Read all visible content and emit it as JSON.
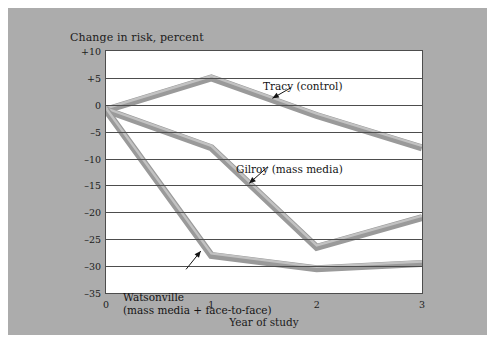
{
  "figure": {
    "background_color": "#ffffff",
    "panel_color": "#acacac",
    "plot_background": "#ffffff",
    "line_color": "#9a9a9a",
    "axis_color": "#4d4d4d",
    "text_color": "#1b1b1b"
  },
  "chart_data": {
    "type": "line",
    "title": "",
    "ylabel": "Change in risk, percent",
    "xlabel": "Year of study",
    "x": [
      0,
      1,
      2,
      3
    ],
    "xticklabels": [
      "0",
      "1",
      "2",
      "3"
    ],
    "xlim": [
      0,
      3
    ],
    "ylim": [
      -35,
      10
    ],
    "yticks": [
      10,
      5,
      0,
      -5,
      -10,
      -15,
      -20,
      -25,
      -30,
      -35
    ],
    "yticklabels": [
      "+10",
      "+5",
      "0",
      "–5",
      "–10",
      "–15",
      "–20",
      "–25",
      "–30",
      "–35"
    ],
    "grid": true,
    "grid_axis": "y",
    "legend": "annotations",
    "series": [
      {
        "name": "Tracy (control)",
        "label": "Tracy (control)",
        "values": [
          -1,
          5,
          -2,
          -8
        ],
        "color": "#9a9a9a"
      },
      {
        "name": "Gilroy (mass media)",
        "label": "Gilroy (mass media)",
        "values": [
          -1,
          -8,
          -26.5,
          -21
        ],
        "color": "#9a9a9a"
      },
      {
        "name": "Watsonville (mass media + face-to-face)",
        "label": "Watsonville\n(mass media + face-to-face)",
        "label_line1": "Watsonville",
        "label_line2": "(mass media + face-to-face)",
        "values": [
          -1,
          -28,
          -30.5,
          -29.5
        ],
        "color": "#9a9a9a"
      }
    ],
    "annotations": [
      {
        "text": "Tracy (control)",
        "target_series": "Tracy (control)"
      },
      {
        "text": "Gilroy (mass media)",
        "target_series": "Gilroy (mass media)"
      },
      {
        "text": "Watsonville (mass media + face-to-face)",
        "target_series": "Watsonville (mass media + face-to-face)"
      }
    ]
  }
}
